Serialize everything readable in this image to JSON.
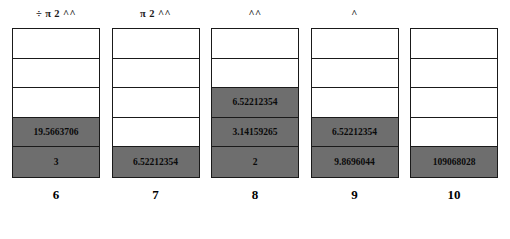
{
  "figure": {
    "type": "stack-diagram",
    "rows_per_stack": 5,
    "fill_color": "#6e6e6e",
    "empty_color": "#ffffff",
    "border_color": "#1a1a1a",
    "columns": [
      {
        "header": "÷ π 2 ^^",
        "label": "6",
        "cells": [
          {
            "value": "",
            "filled": false
          },
          {
            "value": "",
            "filled": false
          },
          {
            "value": "",
            "filled": false
          },
          {
            "value": "19.5663706",
            "filled": true
          },
          {
            "value": "3",
            "filled": true
          }
        ]
      },
      {
        "header": "π 2 ^^",
        "label": "7",
        "cells": [
          {
            "value": "",
            "filled": false
          },
          {
            "value": "",
            "filled": false
          },
          {
            "value": "",
            "filled": false
          },
          {
            "value": "",
            "filled": false
          },
          {
            "value": "6.52212354",
            "filled": true
          }
        ]
      },
      {
        "header": "^^",
        "label": "8",
        "cells": [
          {
            "value": "",
            "filled": false
          },
          {
            "value": "",
            "filled": false
          },
          {
            "value": "6.52212354",
            "filled": true
          },
          {
            "value": "3.14159265",
            "filled": true
          },
          {
            "value": "2",
            "filled": true
          }
        ]
      },
      {
        "header": "^",
        "label": "9",
        "cells": [
          {
            "value": "",
            "filled": false
          },
          {
            "value": "",
            "filled": false
          },
          {
            "value": "",
            "filled": false
          },
          {
            "value": "6.52212354",
            "filled": true
          },
          {
            "value": "9.8696044",
            "filled": true
          }
        ]
      },
      {
        "header": "",
        "label": "10",
        "cells": [
          {
            "value": "",
            "filled": false
          },
          {
            "value": "",
            "filled": false
          },
          {
            "value": "",
            "filled": false
          },
          {
            "value": "",
            "filled": false
          },
          {
            "value": "109068028",
            "filled": true
          }
        ]
      }
    ]
  }
}
